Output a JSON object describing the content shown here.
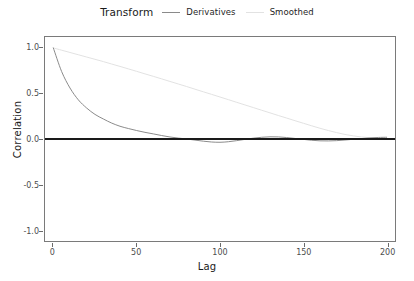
{
  "legend": {
    "title": "Transform",
    "items": [
      {
        "label": "Derivatives",
        "color": "#8a8a8a",
        "key": "line-solid"
      },
      {
        "label": "Smoothed",
        "color": "#e2e2e2",
        "key": "line-solid-light"
      }
    ]
  },
  "axes": {
    "x_title": "Lag",
    "y_title": "Correlation",
    "x_ticks": [
      "0",
      "50",
      "100",
      "150",
      "200"
    ],
    "y_ticks": [
      "1.0",
      "0.5",
      "0.0",
      "-0.5",
      "-1.0"
    ]
  },
  "chart_data": {
    "type": "line",
    "title": "",
    "subtitle": "",
    "xlabel": "Lag",
    "ylabel": "Correlation",
    "xlim": [
      -5,
      205
    ],
    "ylim": [
      -1.12,
      1.12
    ],
    "grid": false,
    "legend_position": "top",
    "legend_title": "Transform",
    "reference_lines": [
      {
        "orientation": "horizontal",
        "y": 0,
        "color": "#1a1a1a",
        "width": 2
      }
    ],
    "x": [
      0,
      5,
      10,
      15,
      20,
      25,
      30,
      35,
      40,
      45,
      50,
      55,
      60,
      65,
      70,
      75,
      80,
      85,
      90,
      95,
      100,
      105,
      110,
      115,
      120,
      125,
      130,
      135,
      140,
      145,
      150,
      155,
      160,
      165,
      170,
      175,
      180,
      185,
      190,
      195,
      200
    ],
    "series": [
      {
        "name": "Derivatives",
        "color": "#8a8a8a",
        "values": [
          1.0,
          0.74,
          0.56,
          0.43,
          0.34,
          0.27,
          0.22,
          0.175,
          0.14,
          0.115,
          0.093,
          0.073,
          0.056,
          0.038,
          0.022,
          0.01,
          0.0,
          -0.012,
          -0.024,
          -0.033,
          -0.036,
          -0.03,
          -0.018,
          -0.004,
          0.009,
          0.019,
          0.024,
          0.023,
          0.016,
          0.006,
          -0.004,
          -0.014,
          -0.02,
          -0.021,
          -0.018,
          -0.011,
          -0.003,
          0.005,
          0.012,
          0.017,
          0.019
        ]
      },
      {
        "name": "Smoothed",
        "color": "#e2e2e2",
        "values": [
          1.0,
          0.975,
          0.95,
          0.925,
          0.9,
          0.875,
          0.85,
          0.823,
          0.797,
          0.77,
          0.743,
          0.715,
          0.688,
          0.66,
          0.632,
          0.604,
          0.576,
          0.547,
          0.518,
          0.49,
          0.461,
          0.432,
          0.403,
          0.374,
          0.345,
          0.316,
          0.287,
          0.258,
          0.23,
          0.201,
          0.173,
          0.145,
          0.118,
          0.093,
          0.07,
          0.05,
          0.034,
          0.022,
          0.014,
          0.008,
          0.004
        ]
      }
    ]
  }
}
